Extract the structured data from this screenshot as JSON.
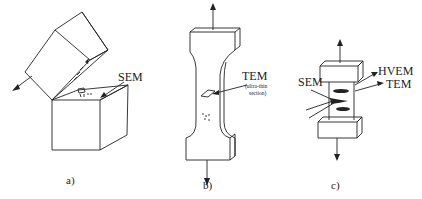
{
  "figure": {
    "panels": [
      {
        "id": "a",
        "caption": "a)",
        "labels": [
          "SEM"
        ],
        "description": "Fractured cube specimen with upper half tilted open; SEM probe arrow pointing at top fracture surface"
      },
      {
        "id": "b",
        "caption": "b)",
        "labels": [
          "TEM",
          "(ultra-thin",
          "section)"
        ],
        "description": "Dog-bone tensile specimen with arrows up and down; TEM ultra-thin section taken from gauge region"
      },
      {
        "id": "c",
        "caption": "c)",
        "labels": [
          "SEM",
          "HVEM",
          "TEM"
        ],
        "description": "Small in-situ tensile specimen with grips; SEM beams on left, HVEM and TEM beams on right"
      }
    ]
  },
  "colors": {
    "ink": "#222222",
    "background": "#ffffff"
  }
}
